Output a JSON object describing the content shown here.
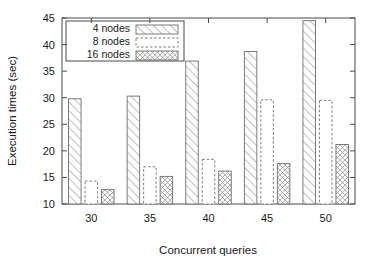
{
  "chart_data": {
    "type": "bar",
    "title": "",
    "xlabel": "Concurrent queries",
    "ylabel": "Execution times (sec)",
    "categories": [
      "30",
      "35",
      "40",
      "45",
      "50"
    ],
    "series": [
      {
        "name": "4 nodes",
        "pattern": "diagonal-lines",
        "values": [
          29.8,
          30.3,
          36.9,
          38.7,
          44.5
        ]
      },
      {
        "name": "8 nodes",
        "pattern": "dashed-outline",
        "values": [
          14.3,
          17.0,
          18.4,
          29.6,
          29.5
        ]
      },
      {
        "name": "16 nodes",
        "pattern": "crosshatch-dots",
        "values": [
          12.7,
          15.2,
          16.2,
          17.6,
          21.2
        ]
      }
    ],
    "ylim": [
      10,
      45
    ],
    "yticks": [
      "10",
      "15",
      "20",
      "25",
      "30",
      "35",
      "40",
      "45"
    ],
    "xticks": [
      "30",
      "35",
      "40",
      "45",
      "50"
    ],
    "grid": false,
    "legend_position": "top-left-inside",
    "colors": {
      "background": "#ffffff",
      "axis": "#4a4a4a",
      "bar_outline": "#6e6e6e",
      "text": "#1a1a1a"
    }
  },
  "legend": {
    "entries": [
      {
        "label": "4 nodes"
      },
      {
        "label": "8 nodes"
      },
      {
        "label": "16 nodes"
      }
    ]
  }
}
